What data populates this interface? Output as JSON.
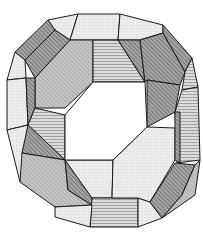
{
  "figure": {
    "colors": {
      "background": "#ffffff",
      "edge": "#1a1a1a",
      "light": "#e4e4e4",
      "lighter": "#eeeeee",
      "medium": "#bdbdbd",
      "dark": "#8e8e8e",
      "darker": "#7a7a7a",
      "hatch": "#c8c8c8"
    },
    "faces": [
      {
        "id": "top-left-top",
        "shade": "lighter",
        "points": "48,20 78,14 70,40 55,30"
      },
      {
        "id": "top-center-left",
        "shade": "lighter",
        "points": "78,14 120,14 118,40 70,40"
      },
      {
        "id": "top-center-right",
        "shade": "lighter",
        "points": "120,14 163,25 163,33 140,40 118,40"
      },
      {
        "id": "top-right-corner",
        "shade": "dark",
        "points": "163,25 192,58 185,72 163,33"
      },
      {
        "id": "upper-left-band",
        "shade": "darker",
        "points": "48,20 55,30 25,60 15,52"
      },
      {
        "id": "upper-left-band-inner",
        "shade": "dark",
        "points": "55,30 70,40 35,78 25,60"
      },
      {
        "id": "upper-left-octagon",
        "shade": "medium",
        "points": "70,40 93,40 93,82 65,108 35,108 35,78"
      },
      {
        "id": "top-inner-hatch",
        "shade": "hatch",
        "points": "93,40 118,40 145,82 93,82"
      },
      {
        "id": "top-inner-dark",
        "shade": "dark",
        "points": "118,40 140,40 145,82"
      },
      {
        "id": "upper-right-octagon",
        "shade": "dark",
        "points": "140,40 163,33 185,72 180,85 147,80 145,82"
      },
      {
        "id": "right-upper-band",
        "shade": "darker",
        "points": "147,80 180,85 175,112 147,127"
      },
      {
        "id": "left-outer-top",
        "shade": "lighter",
        "points": "15,52 25,60 26,78 7,80"
      },
      {
        "id": "left-outer-mid",
        "shade": "lighter",
        "points": "7,80 26,78 28,125 7,130"
      },
      {
        "id": "left-outer-low",
        "shade": "lighter",
        "points": "7,130 28,125 22,182 20,182"
      },
      {
        "id": "left-mid-dark",
        "shade": "dark",
        "points": "26,78 35,78 35,108 28,125"
      },
      {
        "id": "left-mid-hatch",
        "shade": "hatch",
        "points": "35,108 65,115 65,160 28,125"
      },
      {
        "id": "left-lower-dark",
        "shade": "dark",
        "points": "28,125 65,160 22,153"
      },
      {
        "id": "lower-left-octagon",
        "shade": "medium",
        "points": "22,153 65,160 68,190 92,205 55,207 20,182"
      },
      {
        "id": "lower-left-band",
        "shade": "dark",
        "points": "65,160 68,190 92,205 92,198"
      },
      {
        "id": "bottom-inner",
        "shade": "lighter",
        "points": "65,160 113,160 112,198 92,198"
      },
      {
        "id": "bottom-hatch",
        "shade": "hatch",
        "points": "92,198 138,198 138,227 90,227"
      },
      {
        "id": "bottom-left-face",
        "shade": "lighter",
        "points": "55,207 92,205 90,227 55,217"
      },
      {
        "id": "bottom-right-face",
        "shade": "lighter",
        "points": "138,198 150,202 162,218 138,227"
      },
      {
        "id": "lower-right-octagon",
        "shade": "lighter",
        "points": "113,160 147,127 175,128 175,160 150,202 138,198 112,198"
      },
      {
        "id": "right-outer-top",
        "shade": "hatch",
        "points": "185,72 192,58 198,87 182,90"
      },
      {
        "id": "right-outer-mid",
        "shade": "hatch",
        "points": "175,112 182,90 198,87 200,160 177,163"
      },
      {
        "id": "right-inner-strip",
        "shade": "dark",
        "points": "175,112 180,112 180,163 175,160"
      },
      {
        "id": "lower-right-band",
        "shade": "dark",
        "points": "150,202 175,163 195,165 182,195 162,218"
      },
      {
        "id": "lower-right-band-outer",
        "shade": "medium",
        "points": "182,195 195,165 200,160 195,195 162,218"
      }
    ],
    "hole": {
      "points": "93,82 145,82 147,127 113,160 65,160 65,115"
    }
  }
}
